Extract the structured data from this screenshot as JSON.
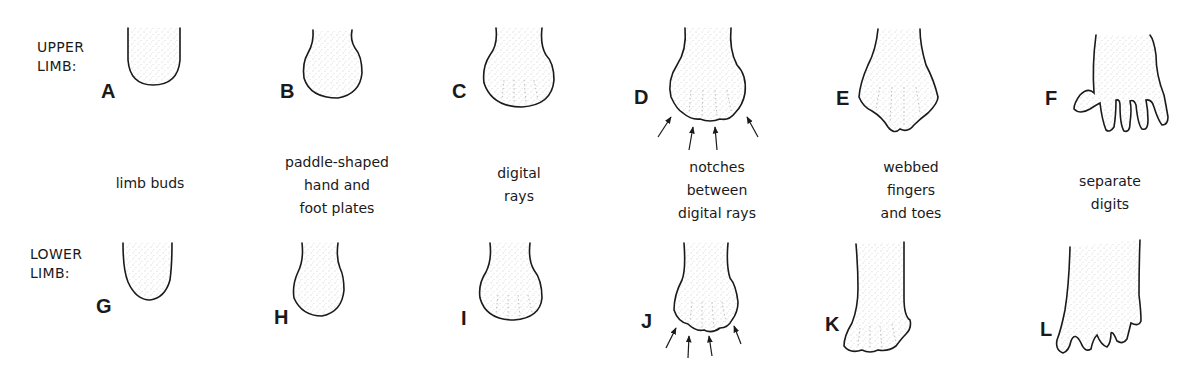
{
  "diagram": {
    "rows": [
      {
        "id": "upper",
        "label_line1": "UPPER",
        "label_line2": "LIMB:"
      },
      {
        "id": "lower",
        "label_line1": "LOWER",
        "label_line2": "LIMB:"
      }
    ],
    "stages": [
      {
        "upper": "A",
        "lower": "G",
        "caption": [
          "limb buds"
        ]
      },
      {
        "upper": "B",
        "lower": "H",
        "caption": [
          "paddle-shaped",
          "hand and",
          "foot plates"
        ]
      },
      {
        "upper": "C",
        "lower": "I",
        "caption": [
          "digital",
          "rays"
        ]
      },
      {
        "upper": "D",
        "lower": "J",
        "caption": [
          "notches",
          "between",
          "digital rays"
        ]
      },
      {
        "upper": "E",
        "lower": "K",
        "caption": [
          "webbed",
          "fingers",
          "and toes"
        ]
      },
      {
        "upper": "F",
        "lower": "L",
        "caption": [
          "separate",
          "digits"
        ]
      }
    ],
    "colors": {
      "ink": "#1a1a1a",
      "stipple": "#9a9a9a",
      "background": "#ffffff"
    }
  }
}
